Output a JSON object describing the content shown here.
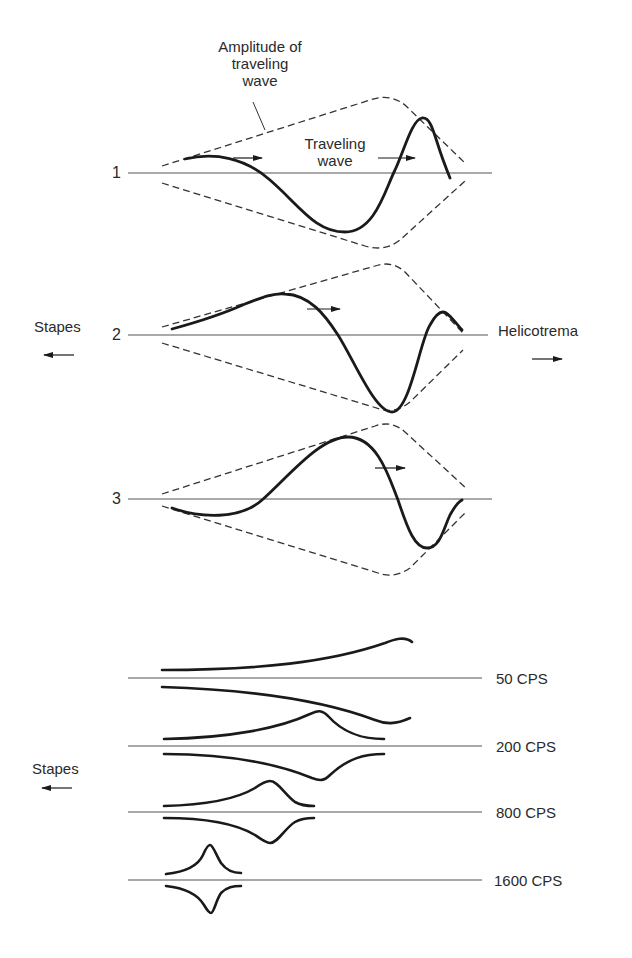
{
  "title_annotation": {
    "line1": "Amplitude of",
    "line2": "traveling",
    "line3": "wave"
  },
  "traveling_wave_label": {
    "line1": "Traveling",
    "line2": "wave"
  },
  "panels": [
    {
      "number": "1"
    },
    {
      "number": "2"
    },
    {
      "number": "3"
    }
  ],
  "direction_labels": {
    "left": "Stapes",
    "right": "Helicotrema",
    "lower_left": "Stapes",
    "left_arrow_icon": "arrow-left-icon",
    "right_arrow_icon": "arrow-right-icon"
  },
  "frequency_profiles": [
    {
      "label": "50 CPS"
    },
    {
      "label": "200 CPS"
    },
    {
      "label": "800 CPS"
    },
    {
      "label": "1600 CPS"
    }
  ],
  "colors": {
    "ink": "#1a1a1a",
    "thin_line": "#555555",
    "background": "#ffffff"
  }
}
